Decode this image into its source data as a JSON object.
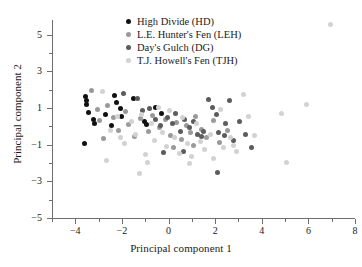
{
  "chart_data": {
    "type": "scatter",
    "title": "",
    "xlabel": "Principal component 1",
    "ylabel": "Principal component 2",
    "xlim": [
      -5,
      8
    ],
    "ylim": [
      -5,
      5.8
    ],
    "xticks": [
      -4,
      -2,
      0,
      2,
      4,
      6,
      8
    ],
    "xticklabels": [
      "−4",
      "−2",
      "0",
      "2",
      "4",
      "6",
      "8"
    ],
    "xminorticks": [
      -5,
      -3,
      -1,
      1,
      3,
      5,
      7
    ],
    "yticks": [
      5,
      3,
      1,
      -1,
      -3,
      -5
    ],
    "yticklabels": [
      "5",
      "3",
      "1",
      "−1",
      "−3",
      "−5"
    ],
    "yminorticks": [
      4,
      2,
      0,
      -2,
      -4
    ],
    "grid": false,
    "legend_position": "top-center",
    "series": [
      {
        "name": "High Divide (HD)",
        "abbr": "HD",
        "color": "#111111",
        "points": [
          [
            -3.55,
            1.62
          ],
          [
            -3.5,
            1.42
          ],
          [
            -3.52,
            1.2
          ],
          [
            -3.45,
            0.78
          ],
          [
            -3.2,
            0.35
          ],
          [
            -3.18,
            0.18
          ],
          [
            -3.6,
            -0.95
          ],
          [
            -2.7,
            0.62
          ],
          [
            -2.3,
            1.7
          ],
          [
            -2.25,
            1.32
          ],
          [
            -2.05,
            0.95
          ],
          [
            -2.02,
            0.55
          ],
          [
            -2.45,
            0.05
          ],
          [
            -1.5,
            1.52
          ],
          [
            -1.05,
            0.28
          ],
          [
            -0.95,
            0.1
          ],
          [
            -0.55,
            1.05
          ],
          [
            -0.3,
            0.7
          ]
        ]
      },
      {
        "name": "L.E. Hunter's Fen (LEH)",
        "abbr": "LEH",
        "color": "#9a9a9a",
        "points": [
          [
            -3.3,
            1.95
          ],
          [
            -3.05,
            0.92
          ],
          [
            -2.95,
            0.3
          ],
          [
            -2.6,
            1.12
          ],
          [
            -2.35,
            0.48
          ],
          [
            -2.15,
            -0.2
          ],
          [
            -1.85,
            0.82
          ],
          [
            -1.7,
            0.12
          ],
          [
            -1.45,
            -0.55
          ],
          [
            -1.2,
            0.45
          ],
          [
            -0.85,
            -0.3
          ],
          [
            -0.7,
            0.6
          ],
          [
            -0.4,
            -0.05
          ],
          [
            -0.15,
            0.38
          ],
          [
            0.1,
            -0.48
          ],
          [
            0.35,
            0.22
          ],
          [
            0.55,
            -0.72
          ],
          [
            0.75,
            0.05
          ],
          [
            0.95,
            -0.35
          ],
          [
            1.15,
            0.55
          ],
          [
            1.4,
            -0.18
          ],
          [
            1.65,
            -0.62
          ],
          [
            1.95,
            0.32
          ],
          [
            2.2,
            -0.9
          ],
          [
            2.55,
            -0.25
          ],
          [
            -2.8,
            -0.68
          ],
          [
            0.2,
            -1.15
          ],
          [
            1.05,
            -1.05
          ]
        ]
      },
      {
        "name": "Day's Gulch (DG)",
        "abbr": "DG",
        "color": "#5c5c5c",
        "points": [
          [
            -1.95,
            1.78
          ],
          [
            -1.35,
            1.52
          ],
          [
            -1.1,
            0.88
          ],
          [
            -0.8,
            0.95
          ],
          [
            -0.55,
            0.35
          ],
          [
            -0.35,
            0.05
          ],
          [
            -0.05,
            0.48
          ],
          [
            0.15,
            0.15
          ],
          [
            0.3,
            0.72
          ],
          [
            0.5,
            -0.28
          ],
          [
            0.7,
            0.4
          ],
          [
            0.88,
            -0.08
          ],
          [
            1.05,
            0.25
          ],
          [
            1.25,
            -0.45
          ],
          [
            1.42,
            -0.55
          ],
          [
            1.5,
            -0.3
          ],
          [
            1.72,
            1.48
          ],
          [
            1.88,
            1.05
          ],
          [
            2.05,
            0.62
          ],
          [
            2.15,
            -0.35
          ],
          [
            2.4,
            -0.52
          ],
          [
            2.45,
            0.15
          ],
          [
            2.6,
            1.42
          ],
          [
            2.78,
            -0.78
          ],
          [
            3.05,
            0.25
          ],
          [
            3.3,
            -0.45
          ],
          [
            3.55,
            -1.18
          ],
          [
            2.1,
            -2.52
          ],
          [
            -0.2,
            -1.42
          ],
          [
            0.65,
            -1.35
          ]
        ]
      },
      {
        "name": "T.J. Howell's Fen (TJH)",
        "abbr": "TJH",
        "color": "#d2d2d2",
        "points": [
          [
            -2.85,
            1.92
          ],
          [
            -2.5,
            -0.22
          ],
          [
            -2.2,
            0.55
          ],
          [
            -2.05,
            -0.62
          ],
          [
            -1.9,
            -0.95
          ],
          [
            -1.6,
            0.25
          ],
          [
            -1.4,
            -0.45
          ],
          [
            -1.15,
            0.62
          ],
          [
            -1.0,
            -1.55
          ],
          [
            -0.75,
            0.18
          ],
          [
            -0.6,
            -0.78
          ],
          [
            -0.45,
            1.05
          ],
          [
            -0.25,
            -0.35
          ],
          [
            -0.1,
            -1.12
          ],
          [
            0.05,
            0.85
          ],
          [
            0.25,
            -0.62
          ],
          [
            0.45,
            -1.48
          ],
          [
            0.6,
            0.48
          ],
          [
            0.8,
            -0.92
          ],
          [
            1.0,
            -1.62
          ],
          [
            1.2,
            0.15
          ],
          [
            1.35,
            -0.85
          ],
          [
            1.55,
            -1.25
          ],
          [
            1.78,
            -0.42
          ],
          [
            1.95,
            -1.78
          ],
          [
            2.25,
            0.92
          ],
          [
            2.35,
            -1.15
          ],
          [
            2.65,
            -0.62
          ],
          [
            2.9,
            -1.38
          ],
          [
            3.2,
            1.72
          ],
          [
            3.45,
            0.55
          ],
          [
            3.7,
            -0.52
          ],
          [
            4.85,
            0.72
          ],
          [
            5.05,
            -1.95
          ],
          [
            6.95,
            5.55
          ],
          [
            5.9,
            1.18
          ],
          [
            -2.65,
            -1.85
          ],
          [
            -1.25,
            -2.58
          ],
          [
            0.9,
            -2.05
          ],
          [
            2.8,
            -1.05
          ],
          [
            -0.9,
            -1.95
          ]
        ]
      }
    ]
  },
  "legend": {
    "items": [
      {
        "label": "High Divide (HD)",
        "color": "#111111"
      },
      {
        "label": "L.E. Hunter's Fen (LEH)",
        "color": "#9a9a9a"
      },
      {
        "label": "Day's Gulch (DG)",
        "color": "#5c5c5c"
      },
      {
        "label": "T.J. Howell's Fen (TJH)",
        "color": "#d2d2d2"
      }
    ]
  }
}
